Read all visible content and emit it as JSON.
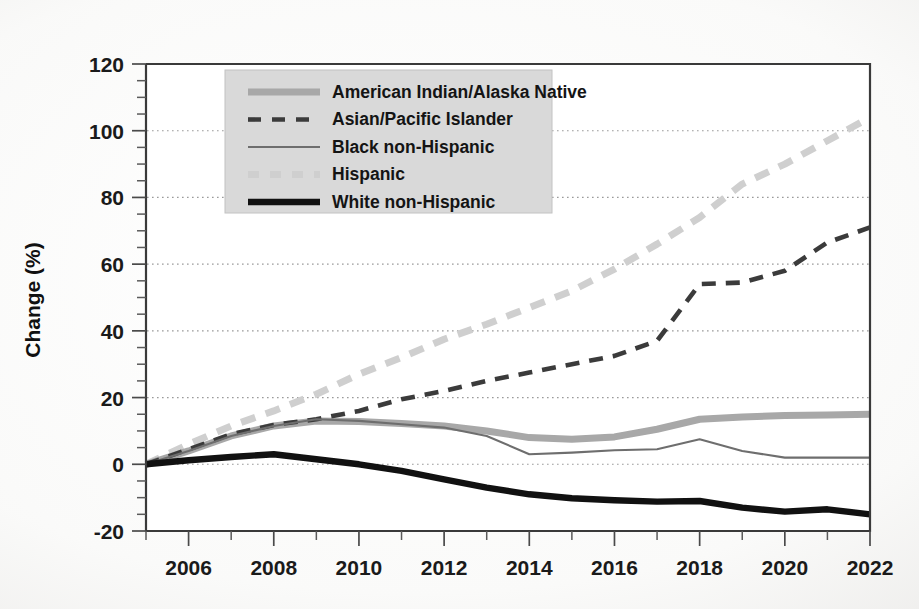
{
  "figure": {
    "background_color": "#fbfbfa",
    "plot_background_color": "#ffffff",
    "axis_color": "#3a3a3a",
    "grid_color": "#9a9a9a",
    "legend_background_color": "#d9d9d9"
  },
  "axes": {
    "y_title": "Change (%)",
    "y_ticks": [
      "-20",
      "0",
      "20",
      "40",
      "60",
      "80",
      "100",
      "120"
    ],
    "x_ticks": [
      "2006",
      "2008",
      "2010",
      "2012",
      "2014",
      "2016",
      "2018",
      "2020",
      "2022"
    ]
  },
  "chart_data": {
    "type": "line",
    "title": "",
    "xlabel": "",
    "ylabel": "Change (%)",
    "xlim": [
      2005,
      2022
    ],
    "ylim": [
      -20,
      120
    ],
    "yticks": [
      -20,
      0,
      20,
      40,
      60,
      80,
      100,
      120
    ],
    "y_minor_tick_step": 5,
    "xticks": [
      2006,
      2008,
      2010,
      2012,
      2014,
      2016,
      2018,
      2020,
      2022
    ],
    "x_minor_tick_step": 1,
    "grid": "horizontal-dotted",
    "legend_position": "upper-left-inside",
    "x": [
      2005,
      2006,
      2007,
      2008,
      2009,
      2010,
      2011,
      2012,
      2013,
      2014,
      2015,
      2016,
      2017,
      2018,
      2019,
      2020,
      2021,
      2022
    ],
    "series": [
      {
        "name": "American Indian/Alaska Native",
        "color": "#a8a8a8",
        "style": "solid-thick",
        "stroke_width": 7,
        "values": [
          0,
          4,
          8.5,
          11.5,
          13,
          12.8,
          12.2,
          11.5,
          10,
          8,
          7.5,
          8.2,
          10.5,
          13.5,
          14.2,
          14.6,
          14.8,
          15
        ]
      },
      {
        "name": "Asian/Pacific Islander",
        "color": "#3b3b3b",
        "style": "dashed",
        "stroke_width": 4.6,
        "dash": "14 10",
        "values": [
          0,
          4.5,
          9,
          11.8,
          13.5,
          16,
          19.5,
          22,
          25,
          27.5,
          30,
          32.5,
          37,
          54,
          54.5,
          58,
          66.5,
          71
        ]
      },
      {
        "name": "Black non-Hispanic",
        "color": "#6e6e6e",
        "style": "solid-thin",
        "stroke_width": 2.1,
        "values": [
          0,
          4,
          8.5,
          11.5,
          13.5,
          13,
          12,
          11,
          8.5,
          3,
          3.5,
          4.2,
          4.5,
          7.5,
          4,
          2,
          2,
          2
        ]
      },
      {
        "name": "Hispanic",
        "color": "#cfcfcf",
        "style": "dashed",
        "stroke_width": 7,
        "dash": "15 11",
        "values": [
          0,
          6,
          11.5,
          16,
          21,
          27,
          32,
          37.5,
          42,
          47,
          52,
          58.5,
          66,
          74,
          84,
          90,
          97,
          104
        ]
      },
      {
        "name": "White non-Hispanic",
        "color": "#111111",
        "style": "solid-thick",
        "stroke_width": 6.4,
        "values": [
          0,
          1.2,
          2.2,
          3,
          1.5,
          0,
          -2,
          -4.5,
          -7,
          -9,
          -10.2,
          -10.8,
          -11.2,
          -11,
          -13,
          -14.2,
          -13.5,
          -15
        ]
      }
    ]
  },
  "legend": {
    "items": [
      {
        "label": "American Indian/Alaska Native",
        "swatch": "thick-gray-solid"
      },
      {
        "label": "Asian/Pacific Islander",
        "swatch": "dark-dashed"
      },
      {
        "label": "Black non-Hispanic",
        "swatch": "thin-gray-solid"
      },
      {
        "label": "Hispanic",
        "swatch": "light-gray-dashed"
      },
      {
        "label": "White non-Hispanic",
        "swatch": "thick-black-solid"
      }
    ]
  }
}
